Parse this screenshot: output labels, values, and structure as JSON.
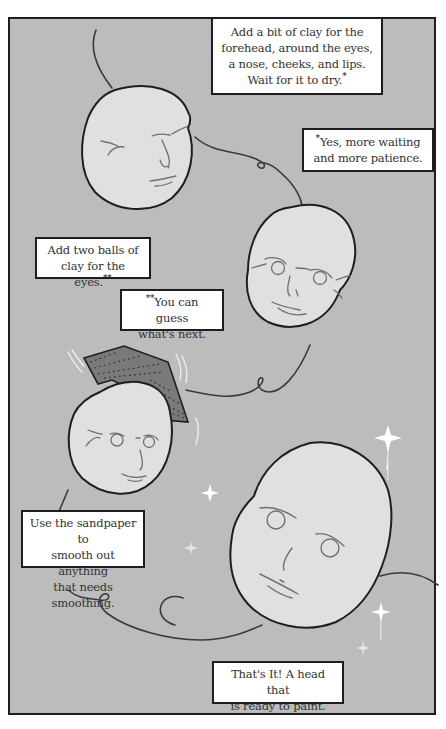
{
  "colors": {
    "panel_bg": "#bcbcbc",
    "face_fill": "#e0e0e0",
    "outline": "#1e1e1e",
    "feature_line": "#707070",
    "sandpaper": "#7a7a7a",
    "sparkle": "#ffffff"
  },
  "captions": [
    {
      "id": "step-forehead",
      "text": "Add a bit of clay for the forehead, around the eyes, a nose, cheeks, and lips. Wait for it to dry.",
      "lines": [
        "Add a bit of clay for the",
        "forehead, around the eyes,",
        "a nose, cheeks, and lips.",
        "Wait for it to dry."
      ],
      "footnote_mark": "*"
    },
    {
      "id": "note-waiting",
      "lines": [
        "Yes, more waiting",
        "and more patience."
      ],
      "lead_mark": "*"
    },
    {
      "id": "step-eyes",
      "lines": [
        "Add two balls of",
        "clay for the eyes."
      ],
      "footnote_mark": "**"
    },
    {
      "id": "note-guess",
      "lines": [
        "You can guess",
        "what's next."
      ],
      "lead_mark": "**"
    },
    {
      "id": "step-sandpaper",
      "lines": [
        "Use the sandpaper to",
        "smooth out anything",
        "that needs smoothing."
      ]
    },
    {
      "id": "step-done",
      "lines": [
        "That's It! A head that",
        "is ready to paint."
      ]
    }
  ],
  "illustrations": [
    {
      "name": "clay-head-with-features",
      "stage": 1
    },
    {
      "name": "clay-head-with-eyes",
      "stage": 2
    },
    {
      "name": "clay-head-being-sanded",
      "stage": 3
    },
    {
      "name": "finished-clay-head",
      "stage": 4
    }
  ]
}
